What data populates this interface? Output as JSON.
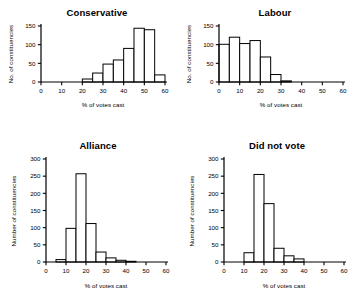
{
  "figure": {
    "background": "#ffffff",
    "ink": "#000000",
    "panel_count": 4
  },
  "chart_data": [
    {
      "type": "bar",
      "title": "Conservative",
      "xlabel": "% of votes cast",
      "ylabel": "No. of constituencies",
      "xlim": [
        0,
        60
      ],
      "ylim": [
        0,
        150
      ],
      "xticks": [
        0,
        10,
        20,
        30,
        40,
        50,
        60
      ],
      "yticks": [
        0,
        50,
        100,
        150
      ],
      "grid": false,
      "legend": "none",
      "bin_width": 5,
      "bin_starts": [
        20,
        25,
        30,
        35,
        40,
        45,
        50,
        55
      ],
      "categories": [
        "20-25",
        "25-30",
        "30-35",
        "35-40",
        "40-45",
        "45-50",
        "50-55",
        "55-60"
      ],
      "values": [
        8,
        24,
        48,
        59,
        90,
        144,
        140,
        19
      ]
    },
    {
      "type": "bar",
      "title": "Labour",
      "xlabel": "% of votes cast",
      "ylabel": "No. of constituencies",
      "xlim": [
        0,
        60
      ],
      "ylim": [
        0,
        150
      ],
      "xticks": [
        0,
        10,
        20,
        30,
        40,
        50,
        60
      ],
      "yticks": [
        0,
        50,
        100,
        150
      ],
      "grid": false,
      "legend": "none",
      "bin_width": 5,
      "bin_starts": [
        0,
        5,
        10,
        15,
        20,
        25,
        30
      ],
      "categories": [
        "0-5",
        "5-10",
        "10-15",
        "15-20",
        "20-25",
        "25-30",
        "30-35"
      ],
      "values": [
        101,
        120,
        103,
        111,
        67,
        20,
        3
      ]
    },
    {
      "type": "bar",
      "title": "Alliance",
      "xlabel": "% of votes cast",
      "ylabel": "Number of constituencies",
      "xlim": [
        0,
        60
      ],
      "ylim": [
        0,
        300
      ],
      "xticks": [
        0,
        10,
        20,
        30,
        40,
        50,
        60
      ],
      "yticks": [
        0,
        50,
        100,
        150,
        200,
        250,
        300
      ],
      "grid": false,
      "legend": "none",
      "bin_width": 5,
      "bin_starts": [
        5,
        10,
        15,
        20,
        25,
        30,
        35,
        40
      ],
      "categories": [
        "5-10",
        "10-15",
        "15-20",
        "20-25",
        "25-30",
        "30-35",
        "35-40",
        "40-45"
      ],
      "values": [
        7,
        98,
        257,
        112,
        29,
        12,
        5,
        2
      ]
    },
    {
      "type": "bar",
      "title": "Did not vote",
      "xlabel": "% of votes cast",
      "ylabel": "Number of constituencies",
      "xlim": [
        0,
        60
      ],
      "ylim": [
        0,
        300
      ],
      "xticks": [
        0,
        10,
        20,
        30,
        40,
        50,
        60
      ],
      "yticks": [
        0,
        50,
        100,
        150,
        200,
        250,
        300
      ],
      "grid": false,
      "legend": "none",
      "bin_width": 5,
      "bin_starts": [
        10,
        15,
        20,
        25,
        30,
        35
      ],
      "categories": [
        "10-15",
        "15-20",
        "20-25",
        "25-30",
        "30-35",
        "35-40"
      ],
      "values": [
        27,
        255,
        170,
        40,
        18,
        9
      ]
    }
  ]
}
